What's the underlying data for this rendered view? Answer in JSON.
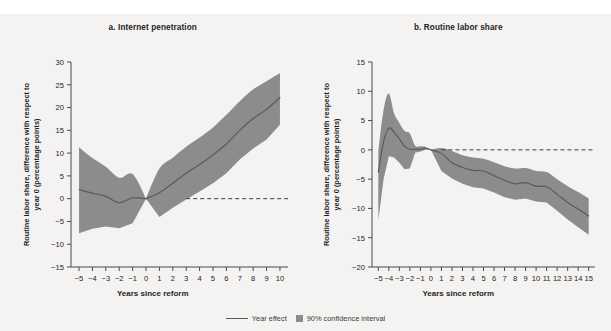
{
  "figure": {
    "background_color": "#f4f3f1",
    "band_color": "#8c8c8c",
    "line_color": "#595959",
    "axis_color": "#4a4a4a"
  },
  "legend": {
    "line_label": "Year effect",
    "band_label": "90% confidence interval"
  },
  "chart_data": [
    {
      "type": "line",
      "panel_id": "a",
      "title": "a. Internet penetration",
      "xlabel": "Years since reform",
      "ylabel_line1": "Routine labor share, difference with respect to",
      "ylabel_line2": "year 0 (percentage points)",
      "grid": false,
      "legend_position": "bottom-center",
      "xlim": [
        -5.6,
        10.6
      ],
      "ylim": [
        -15,
        30
      ],
      "xticks": [
        -5,
        -4,
        -3,
        -2,
        -1,
        0,
        1,
        2,
        3,
        4,
        5,
        6,
        7,
        8,
        9,
        10
      ],
      "xticklabels": [
        "−5",
        "−4",
        "−3",
        "−2",
        "−1",
        "0",
        "1",
        "2",
        "3",
        "4",
        "5",
        "6",
        "7",
        "8",
        "9",
        "10"
      ],
      "yticks": [
        -15,
        -10,
        -5,
        0,
        5,
        10,
        15,
        20,
        25,
        30
      ],
      "yticklabels": [
        "−15",
        "−10",
        "−5",
        "0",
        "5",
        "10",
        "15",
        "20",
        "25",
        "30"
      ],
      "reference_line": {
        "y": 0,
        "style": "dashed",
        "x_from": 3,
        "x_to": 10.6
      },
      "segments": [
        {
          "name": "pre-reform",
          "x": [
            -5,
            -4,
            -3,
            -2,
            -1,
            0
          ],
          "values": [
            2.0,
            1.2,
            0.5,
            -0.9,
            0.2,
            0.0
          ],
          "ci_lower": [
            -7.6,
            -6.6,
            -6.1,
            -6.5,
            -5.4,
            0.0
          ],
          "ci_upper": [
            11.3,
            8.9,
            7.0,
            4.6,
            5.4,
            0.0
          ]
        },
        {
          "name": "post-reform",
          "x": [
            0,
            1,
            2,
            3,
            4,
            5,
            6,
            7,
            8,
            9,
            10
          ],
          "values": [
            0.0,
            1.3,
            3.4,
            5.6,
            7.5,
            9.6,
            12.0,
            15.0,
            17.6,
            19.6,
            22.2
          ],
          "ci_lower": [
            0.0,
            -4.0,
            -2.0,
            -0.2,
            1.6,
            3.4,
            5.6,
            8.6,
            11.0,
            13.0,
            16.2
          ],
          "ci_upper": [
            0.0,
            6.6,
            9.0,
            11.4,
            13.4,
            15.6,
            18.4,
            21.4,
            24.0,
            25.8,
            27.6
          ]
        }
      ]
    },
    {
      "type": "line",
      "panel_id": "b",
      "title": "b. Routine labor share",
      "xlabel": "Years since reform",
      "ylabel_line1": "Routine labor share, difference with respect to",
      "ylabel_line2": "year 0 (percentage points)",
      "grid": false,
      "legend_position": "bottom-center",
      "xlim": [
        -5.6,
        15.6
      ],
      "ylim": [
        -20,
        15
      ],
      "xticks": [
        -5,
        -4,
        -3,
        -2,
        -1,
        0,
        1,
        2,
        3,
        4,
        5,
        6,
        7,
        8,
        9,
        10,
        11,
        12,
        13,
        14,
        15
      ],
      "xticklabels": [
        "−5",
        "−4",
        "−3",
        "−2",
        "−1",
        "0",
        "1",
        "2",
        "3",
        "4",
        "5",
        "6",
        "7",
        "8",
        "9",
        "10",
        "11",
        "12",
        "13",
        "14",
        "15"
      ],
      "yticks": [
        -20,
        -15,
        -10,
        -5,
        0,
        5,
        10,
        15
      ],
      "yticklabels": [
        "−20",
        "−15",
        "−10",
        "−5",
        "0",
        "5",
        "10",
        "15"
      ],
      "reference_line": {
        "y": 0,
        "style": "dashed",
        "x_from": 1,
        "x_to": 15.6
      },
      "segments": [
        {
          "name": "pre-reform",
          "x": [
            -5,
            -4.5,
            -4,
            -3.5,
            -3,
            -2.5,
            -2,
            -1.5,
            -1,
            -0.5,
            0
          ],
          "values": [
            -3.8,
            1.4,
            3.7,
            3.0,
            1.9,
            0.6,
            0.1,
            0.1,
            0.1,
            0.3,
            0.0
          ],
          "ci_lower": [
            -12.0,
            -5.0,
            -1.1,
            -1.3,
            -2.2,
            -3.3,
            -3.2,
            -0.5,
            -0.3,
            0.0,
            0.0
          ],
          "ci_upper": [
            -0.3,
            6.8,
            9.6,
            6.2,
            4.6,
            3.2,
            2.8,
            0.7,
            0.6,
            0.5,
            0.0
          ]
        },
        {
          "name": "post-reform",
          "x": [
            0,
            1,
            2,
            3,
            4,
            5,
            6,
            7,
            8,
            9,
            10,
            11,
            12,
            13,
            14,
            15
          ],
          "values": [
            0.0,
            -0.6,
            -2.2,
            -3.0,
            -3.5,
            -3.6,
            -4.4,
            -5.2,
            -5.8,
            -5.6,
            -6.2,
            -6.3,
            -7.6,
            -9.0,
            -10.1,
            -11.3
          ],
          "ci_lower": [
            0.0,
            -3.6,
            -4.9,
            -5.8,
            -6.4,
            -6.6,
            -7.3,
            -8.1,
            -8.5,
            -8.3,
            -8.8,
            -9.0,
            -10.4,
            -11.9,
            -13.2,
            -14.5
          ],
          "ci_upper": [
            0.0,
            0.3,
            -0.2,
            -0.9,
            -1.3,
            -1.5,
            -2.1,
            -2.8,
            -3.2,
            -3.1,
            -3.6,
            -3.8,
            -5.0,
            -6.2,
            -7.2,
            -8.3
          ]
        }
      ]
    }
  ]
}
